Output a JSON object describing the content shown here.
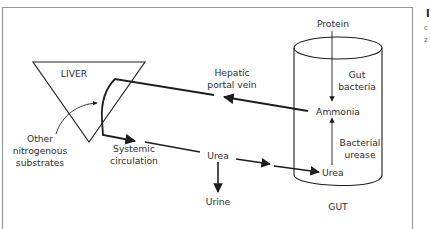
{
  "figure": {
    "type": "flow-diagram",
    "nodes": {
      "liver": "LIVER",
      "gut": "GUT",
      "protein": "Protein",
      "gut_bacteria_1": "Gut",
      "gut_bacteria_2": "bacteria",
      "ammonia": "Ammonia",
      "bacterial_urease_1": "Bacterial",
      "bacterial_urease_2": "urease",
      "urea_gut": "Urea",
      "urea_blood": "Urea",
      "urine": "Urine",
      "hepatic_1": "Hepatic",
      "hepatic_2": "portal vein",
      "systemic_1": "Systemic",
      "systemic_2": "circulation",
      "other_1": "Other",
      "other_2": "nitrogenous",
      "other_3": "substrates"
    },
    "edges": [
      {
        "from": "Protein",
        "to": "Ammonia",
        "via": "Gut bacteria"
      },
      {
        "from": "Urea (gut)",
        "to": "Ammonia",
        "via": "Bacterial urease"
      },
      {
        "from": "Ammonia",
        "to": "LIVER",
        "via": "Hepatic portal vein"
      },
      {
        "from": "Other nitrogenous substrates",
        "to": "LIVER"
      },
      {
        "from": "LIVER",
        "to": "Urea",
        "via": "Systemic circulation"
      },
      {
        "from": "Urea",
        "to": "Urine"
      },
      {
        "from": "Urea",
        "to": "Urea (gut)"
      }
    ],
    "colors": {
      "line": "#1e1e1e",
      "frame": "#9a9a9a",
      "text": "#2e2e2e"
    }
  },
  "side_caption": {
    "glyph_1": "I",
    "glyph_2": "c",
    "glyph_3": "z"
  }
}
